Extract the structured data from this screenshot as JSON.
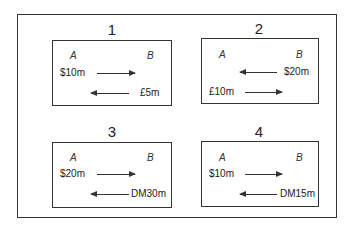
{
  "panels": [
    {
      "number": "1",
      "party_a": "A",
      "party_b": "B",
      "top_flow": {
        "label": "$10m",
        "direction": "A-to-B"
      },
      "bottom_flow": {
        "label": "£5m",
        "direction": "B-to-A"
      }
    },
    {
      "number": "2",
      "party_a": "A",
      "party_b": "B",
      "top_flow": {
        "label": "$20m",
        "direction": "B-to-A"
      },
      "bottom_flow": {
        "label": "£10m",
        "direction": "A-to-B"
      }
    },
    {
      "number": "3",
      "party_a": "A",
      "party_b": "B",
      "top_flow": {
        "label": "$20m",
        "direction": "A-to-B"
      },
      "bottom_flow": {
        "label": "DM30m",
        "direction": "B-to-A"
      }
    },
    {
      "number": "4",
      "party_a": "A",
      "party_b": "B",
      "top_flow": {
        "label": "$10m",
        "direction": "A-to-B"
      },
      "bottom_flow": {
        "label": "DM15m",
        "direction": "B-to-A"
      }
    }
  ]
}
